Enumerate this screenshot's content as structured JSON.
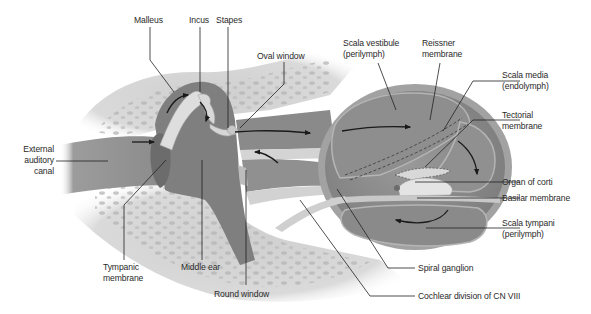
{
  "colors": {
    "background": "#ffffff",
    "bone": "#d6d6d6",
    "bone_spot": "#b3b3b3",
    "canal_fill": "#8e8e8e",
    "middle_ear_fill": "#7f7f7f",
    "cochlea_outer": "#9a9a9a",
    "cochlea_inner": "#8a8a8a",
    "ossicle": "#dcdcdc",
    "arrow": "#1a1a1a",
    "leader_line": "#222222",
    "label_text": "#2a2a2a"
  },
  "labels": {
    "malleus": "Malleus",
    "incus": "Incus",
    "stapes": "Stapes",
    "oval_window": "Oval window",
    "scala_vestibule": "Scala vestibule\n(perilymph)",
    "reissner_membrane": "Reissner\nmembrane",
    "scala_media": "Scala media\n(endolymph)",
    "tectorial_membrane": "Tectorial\nmembrane",
    "external_auditory_canal": "External\nauditory\ncanal",
    "organ_of_corti": "Organ of corti",
    "basilar_membrane": "Basilar membrane",
    "scala_tympani": "Scala tympani\n(perilymph)",
    "tympanic_membrane": "Tympanic\nmembrane",
    "middle_ear": "Middle ear",
    "round_window": "Round window",
    "spiral_ganglion": "Spiral ganglion",
    "cochlear_division": "Cochlear division of CN VIII"
  }
}
